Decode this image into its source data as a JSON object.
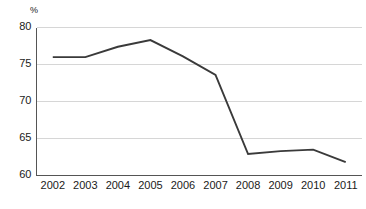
{
  "chart_data": {
    "type": "line",
    "title": "",
    "subtitle": "",
    "xlabel": "",
    "ylabel": "",
    "unit_label": "%",
    "categories": [
      "2002",
      "2003",
      "2004",
      "2005",
      "2006",
      "2007",
      "2008",
      "2009",
      "2010",
      "2011"
    ],
    "x": [
      2002,
      2003,
      2004,
      2005,
      2006,
      2007,
      2008,
      2009,
      2010,
      2011
    ],
    "values": [
      76.0,
      76.0,
      77.4,
      78.3,
      76.1,
      73.6,
      62.9,
      63.3,
      63.5,
      61.8
    ],
    "series": [
      {
        "name": "",
        "values": [
          76.0,
          76.0,
          77.4,
          78.3,
          76.1,
          73.6,
          62.9,
          63.3,
          63.5,
          61.8
        ],
        "color": "#3a3a3a"
      }
    ],
    "ylim": [
      60,
      80
    ],
    "yticks": [
      60,
      65,
      70,
      75,
      80
    ],
    "ytick_labels": [
      "60",
      "65",
      "70",
      "75",
      "80"
    ],
    "xtick_labels": [
      "2002",
      "2003",
      "2004",
      "2005",
      "2006",
      "2007",
      "2008",
      "2009",
      "2010",
      "2011"
    ],
    "grid": true,
    "grid_color": "#d6d6d6",
    "axis_color": "#555555",
    "legend": false,
    "legend_position": "none",
    "annotations": []
  },
  "colors": {
    "background": "#ffffff",
    "line": "#3a3a3a",
    "grid": "#d6d6d6",
    "axis": "#555555",
    "text": "#1a1a1a"
  }
}
